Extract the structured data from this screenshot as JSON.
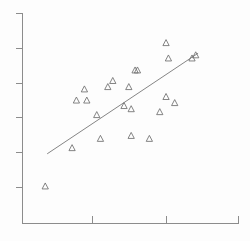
{
  "chart_data": {
    "type": "scatter",
    "title": "",
    "subtitle": "",
    "xlabel": "",
    "ylabel": "",
    "xlim": [
      0,
      100
    ],
    "ylim": [
      0,
      100
    ],
    "grid": false,
    "legend": null,
    "marker": "open-triangle-up",
    "marker_color": "#6e6e6e",
    "line_color": "#777777",
    "axis_color": "#8c8c8c",
    "background_color": "#fdfdfd",
    "x_ticks": [
      29.7,
      59.4
    ],
    "y_ticks": [
      18.3,
      34.7,
      50.7,
      68.1,
      84.4,
      100.0
    ],
    "x_tick_labels": [
      "",
      ""
    ],
    "y_tick_labels": [
      "",
      "",
      "",
      "",
      "",
      ""
    ],
    "points": [
      {
        "x": 10.5,
        "y": 17.7
      },
      {
        "x": 22.9,
        "y": 35.9
      },
      {
        "x": 36.0,
        "y": 40.3
      },
      {
        "x": 50.2,
        "y": 41.7
      },
      {
        "x": 58.6,
        "y": 40.3
      },
      {
        "x": 24.9,
        "y": 58.5
      },
      {
        "x": 29.7,
        "y": 58.5
      },
      {
        "x": 34.3,
        "y": 51.6
      },
      {
        "x": 63.4,
        "y": 53.0
      },
      {
        "x": 50.2,
        "y": 54.4
      },
      {
        "x": 46.9,
        "y": 55.9
      },
      {
        "x": 70.3,
        "y": 57.3
      },
      {
        "x": 66.3,
        "y": 60.2
      },
      {
        "x": 28.6,
        "y": 63.8
      },
      {
        "x": 39.4,
        "y": 64.9
      },
      {
        "x": 49.1,
        "y": 64.9
      },
      {
        "x": 41.7,
        "y": 67.8
      },
      {
        "x": 52.0,
        "y": 72.8
      },
      {
        "x": 53.1,
        "y": 72.8
      },
      {
        "x": 67.4,
        "y": 78.5
      },
      {
        "x": 66.3,
        "y": 85.8
      },
      {
        "x": 78.3,
        "y": 78.5
      },
      {
        "x": 80.0,
        "y": 80.0
      }
    ],
    "fit_line": {
      "label": "",
      "x_start": 11.4,
      "y_start": 33.1,
      "x_end": 81.1,
      "y_end": 80.9
    }
  }
}
